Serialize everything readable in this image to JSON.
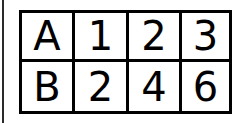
{
  "table": {
    "rows": [
      [
        "A",
        "1",
        "2",
        "3"
      ],
      [
        "B",
        "2",
        "4",
        "6"
      ]
    ]
  }
}
